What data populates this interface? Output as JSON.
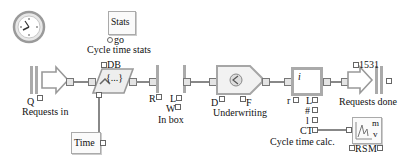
{
  "diagram": {
    "blocks": {
      "clock": {
        "type": "clock-icon"
      },
      "stats": {
        "label": "Stats",
        "port_label": "go",
        "caption": "Cycle time stats"
      },
      "executive_db": {
        "port_label": "DB",
        "inner_label": "{...}"
      },
      "requests_in": {
        "port_label": "Q",
        "caption": "Requests in"
      },
      "time": {
        "label": "Time"
      },
      "in_box": {
        "port_labels": [
          "R",
          "L",
          "W"
        ],
        "caption": "In box"
      },
      "underwriting": {
        "port_labels": [
          "D",
          "F"
        ],
        "caption": "Underwriting"
      },
      "info": {
        "inner_label": "i",
        "port_labels": [
          "r",
          "L",
          "#",
          "l"
        ]
      },
      "requests_done": {
        "count": "1531",
        "caption": "Requests done"
      },
      "cycle_time_calc": {
        "port_label": "CT",
        "caption": "Cycle time calc."
      },
      "plot": {
        "labels": [
          "m",
          "v"
        ],
        "port_labels": [
          "R",
          "S",
          "M"
        ]
      }
    },
    "colors": {
      "block_fill": "#f4f4f4",
      "block_border": "#a8a8a8",
      "wire": "#888888",
      "accent": "#8a8a8a"
    }
  }
}
